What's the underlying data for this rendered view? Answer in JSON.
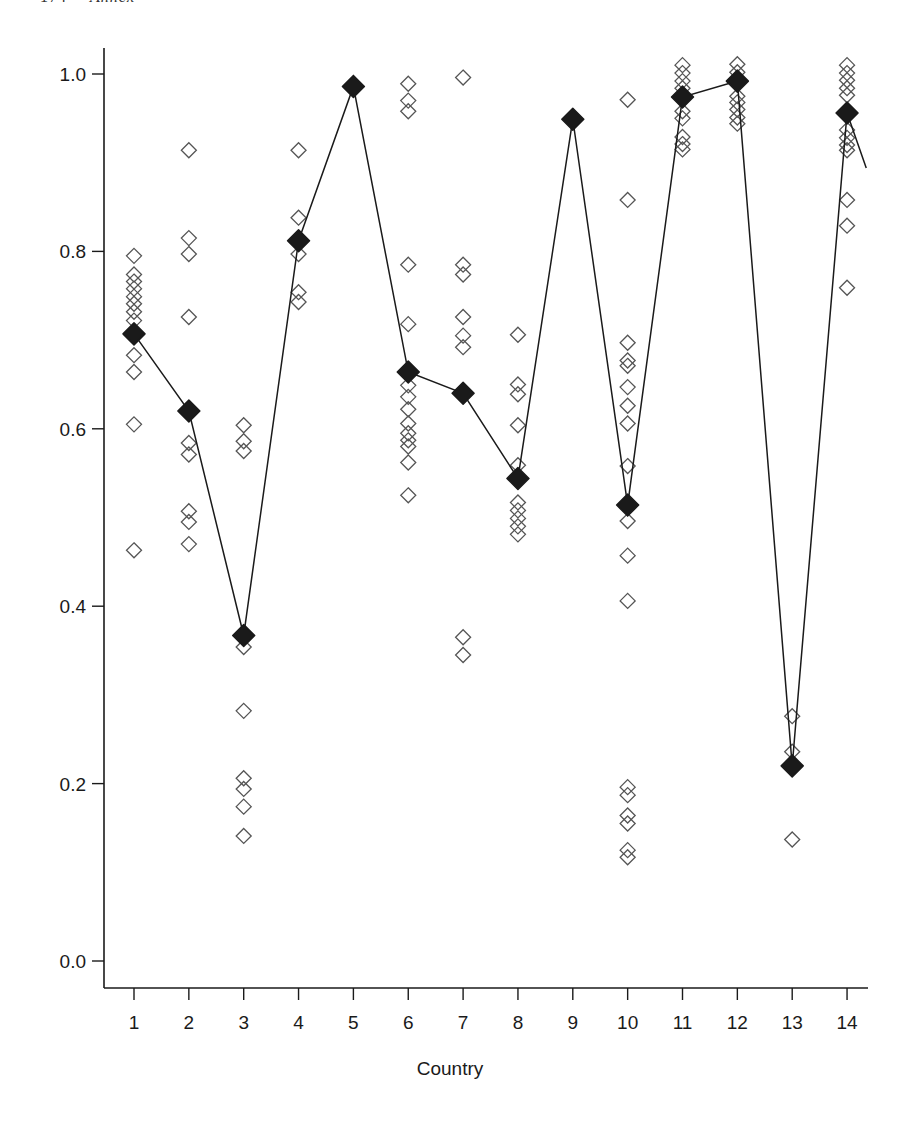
{
  "page_header": {
    "page_number": "174",
    "running_title": "Annex"
  },
  "colors": {
    "ink": "#1a1a1a",
    "open_marker": "#555555",
    "background": "#ffffff"
  },
  "chart_data": {
    "type": "scatter",
    "title": "",
    "xlabel": "Country",
    "ylabel": "",
    "x_ticks": [
      1,
      2,
      3,
      4,
      5,
      6,
      7,
      8,
      9,
      10,
      11,
      12,
      13,
      14
    ],
    "y_ticks": [
      0.0,
      0.2,
      0.4,
      0.6,
      0.8,
      1.0
    ],
    "y_tick_labels": [
      "0.0",
      "0.2",
      "0.4",
      "0.6",
      "0.8",
      "1.0"
    ],
    "ylim": [
      0.0,
      1.0
    ],
    "xlim": [
      0.4,
      14.4
    ],
    "grid": false,
    "legend": null,
    "series": [
      {
        "name": "individual observations",
        "marker": "open-diamond",
        "points": {
          "1": [
            0.795,
            0.774,
            0.766,
            0.758,
            0.749,
            0.741,
            0.732,
            0.722,
            0.683,
            0.664,
            0.605,
            0.463
          ],
          "2": [
            0.914,
            0.815,
            0.797,
            0.726,
            0.584,
            0.571,
            0.507,
            0.495,
            0.47
          ],
          "3": [
            0.604,
            0.586,
            0.575,
            0.354,
            0.282,
            0.206,
            0.194,
            0.174,
            0.141
          ],
          "4": [
            0.914,
            0.838,
            0.797,
            0.754,
            0.743
          ],
          "5": [],
          "6": [
            0.989,
            0.97,
            0.958,
            0.785,
            0.718,
            0.649,
            0.636,
            0.622,
            0.606,
            0.595,
            0.587,
            0.58,
            0.562,
            0.525
          ],
          "7": [
            0.996,
            0.785,
            0.774,
            0.726,
            0.705,
            0.692,
            0.365,
            0.345
          ],
          "8": [
            0.706,
            0.65,
            0.639,
            0.604,
            0.559,
            0.517,
            0.508,
            0.499,
            0.49,
            0.481
          ],
          "9": [],
          "10": [
            0.971,
            0.858,
            0.697,
            0.677,
            0.671,
            0.647,
            0.626,
            0.606,
            0.558,
            0.496,
            0.457,
            0.406,
            0.196,
            0.187,
            0.164,
            0.155,
            0.125,
            0.117
          ],
          "11": [
            1.01,
            1.001,
            0.992,
            0.984,
            0.975,
            0.958,
            0.95,
            0.929,
            0.921,
            0.915
          ],
          "12": [
            1.011,
            1.002,
            0.975,
            0.968,
            0.96,
            0.951,
            0.944
          ],
          "13": [
            0.276,
            0.236,
            0.137
          ],
          "14": [
            1.01,
            1.001,
            0.993,
            0.984,
            0.976,
            0.937,
            0.928,
            0.92,
            0.914,
            0.858,
            0.829,
            0.759
          ]
        }
      },
      {
        "name": "country value",
        "marker": "filled-diamond",
        "line": true,
        "x": [
          1,
          2,
          3,
          4,
          5,
          6,
          7,
          8,
          9,
          10,
          11,
          12,
          13,
          14
        ],
        "values": [
          0.707,
          0.62,
          0.367,
          0.812,
          0.986,
          0.664,
          0.64,
          0.544,
          0.949,
          0.514,
          0.974,
          0.992,
          0.22,
          0.956
        ],
        "trailing_segment_to": {
          "x": 14.35,
          "y": 0.894
        }
      }
    ]
  },
  "layout": {
    "plot_left_px": 104,
    "axis_bottom_px": 988,
    "axis_right_px": 868,
    "axis_top_px": 48,
    "x1_px": 134,
    "x_step_px": 54.85,
    "y0_px": 961,
    "y_scale_px": 887
  }
}
